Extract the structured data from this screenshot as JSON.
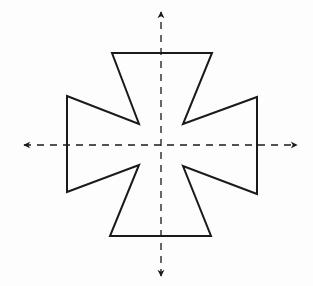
{
  "diagram": {
    "type": "symmetry-figure",
    "colors": {
      "background": "#fdfdfd",
      "stroke": "#1a1a1a"
    },
    "shape": {
      "name": "cross",
      "points": [
        [
          112,
          53
        ],
        [
          212,
          53
        ],
        [
          183,
          124
        ],
        [
          257,
          97
        ],
        [
          257,
          194
        ],
        [
          183,
          166
        ],
        [
          211,
          236
        ],
        [
          110,
          236
        ],
        [
          139,
          165
        ],
        [
          67,
          192
        ],
        [
          67,
          96
        ],
        [
          139,
          124
        ]
      ]
    },
    "axes": [
      {
        "name": "vertical-symmetry-line",
        "x1": 161,
        "y1": 276,
        "x2": 161,
        "y2": 12,
        "style": "dashed",
        "arrows": "both"
      },
      {
        "name": "horizontal-symmetry-line",
        "x1": 24,
        "y1": 145,
        "x2": 297,
        "y2": 145,
        "style": "dashed",
        "arrows": "both"
      }
    ]
  }
}
